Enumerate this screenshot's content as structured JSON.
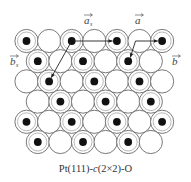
{
  "figure": {
    "caption_prefix": "Pt(111)-",
    "caption_italic": "c",
    "caption_suffix": "(2×2)-O",
    "colors": {
      "atom_fill": "#ffffff",
      "atom_outline": "#6a6a6a",
      "adsorbate": "#111111",
      "vector": "#222222"
    },
    "lattice": {
      "rows": [
        {
          "count": 7,
          "offset": 0,
          "adsorbate_cols": [
            0,
            2,
            4,
            6
          ]
        },
        {
          "count": 6,
          "offset": 0.5,
          "adsorbate_cols": [
            0,
            2,
            4
          ]
        },
        {
          "count": 7,
          "offset": 0,
          "adsorbate_cols": [
            1,
            3,
            5
          ]
        },
        {
          "count": 6,
          "offset": 0.5,
          "adsorbate_cols": [
            1,
            3,
            5
          ]
        },
        {
          "count": 7,
          "offset": 0,
          "adsorbate_cols": [
            0,
            2,
            4,
            6
          ]
        },
        {
          "count": 6,
          "offset": 0.5,
          "adsorbate_cols": [
            0,
            2,
            4
          ]
        }
      ]
    },
    "vectors": [
      {
        "name": "a_s",
        "label": "a",
        "subscript": "s",
        "from": [
          0,
          2
        ],
        "to": [
          0,
          4
        ]
      },
      {
        "name": "b_s",
        "label": "b",
        "subscript": "s",
        "from": [
          0,
          2
        ],
        "to": [
          2,
          1
        ]
      },
      {
        "name": "a",
        "label": "a",
        "subscript": "",
        "from": [
          0,
          5
        ],
        "to": [
          0,
          6
        ]
      },
      {
        "name": "b",
        "label": "b",
        "subscript": "",
        "from": [
          0,
          5
        ],
        "to": [
          1,
          4
        ]
      }
    ]
  }
}
